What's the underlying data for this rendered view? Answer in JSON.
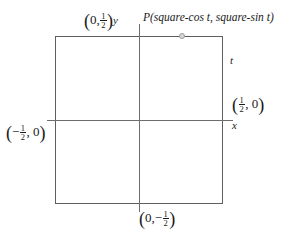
{
  "figure": {
    "type": "coordinate-diagram",
    "background_color": "#ffffff",
    "line_color": "#6d6d6d",
    "square_color": "#5f5f5f",
    "marker_color": "#d8d8d8"
  },
  "axes": {
    "x_label": "x",
    "y_label": "y",
    "origin": "(0, 0)"
  },
  "labels": {
    "point_p": "P(square-cos t, square-sin t)",
    "parameter_t": "t",
    "top_vertex_open": "(",
    "top_vertex_zero": "0,",
    "top_vertex_num": "1",
    "top_vertex_den": "2",
    "top_vertex_close": ")",
    "right_vertex_open": "(",
    "right_vertex_num": "1",
    "right_vertex_den": "2",
    "right_vertex_zero": ", 0",
    "right_vertex_close": ")",
    "left_vertex_open": "(",
    "left_vertex_minus": "−",
    "left_vertex_num": "1",
    "left_vertex_den": "2",
    "left_vertex_zero": ", 0",
    "left_vertex_close": ")",
    "bottom_vertex_open": "(",
    "bottom_vertex_zero": "0,",
    "bottom_vertex_minus": "−",
    "bottom_vertex_num": "1",
    "bottom_vertex_den": "2",
    "bottom_vertex_close": ")"
  },
  "chart_data": {
    "type": "scatter",
    "title": "",
    "xlabel": "x",
    "ylabel": "y",
    "xlim": [
      -0.55,
      0.56
    ],
    "ylim": [
      -0.56,
      0.57
    ],
    "grid": false,
    "legend": null,
    "annotations": [
      {
        "text": "(0, 1/2)",
        "x": 0,
        "y": 0.5
      },
      {
        "text": "(1/2, 0)",
        "x": 0.5,
        "y": 0
      },
      {
        "text": "(-1/2, 0)",
        "x": -0.5,
        "y": 0
      },
      {
        "text": "(0, -1/2)",
        "x": 0,
        "y": -0.5
      },
      {
        "text": "t",
        "x": 0.5,
        "y": 0.33
      },
      {
        "text": "P(square-cos t, square-sin t)",
        "x": 0.25,
        "y": 0.5
      }
    ],
    "shapes": [
      {
        "kind": "square",
        "x_min": -0.5,
        "x_max": 0.5,
        "y_min": -0.5,
        "y_max": 0.5
      }
    ],
    "points": [
      {
        "name": "P",
        "x": 0.25,
        "y": 0.5
      }
    ]
  }
}
